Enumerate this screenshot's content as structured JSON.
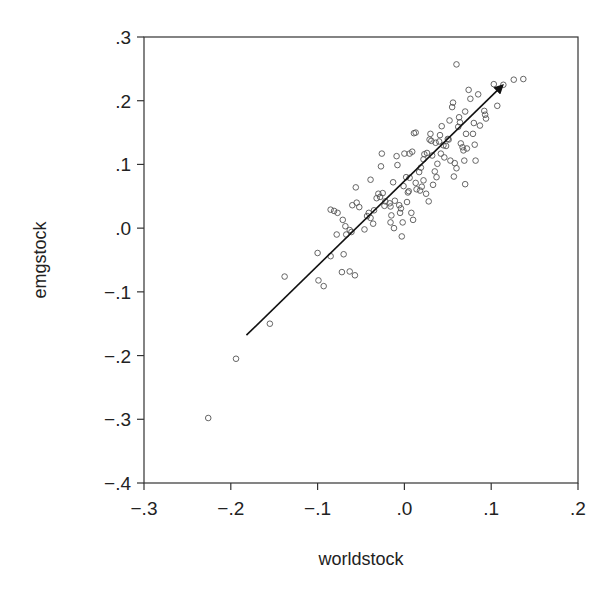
{
  "chart_data": {
    "type": "scatter",
    "title": "",
    "xlabel": "worldstock",
    "ylabel": "emgstock",
    "xlim": [
      -0.3,
      0.2
    ],
    "ylim": [
      -0.4,
      0.3
    ],
    "grid": false,
    "legend": null,
    "x_ticks": [
      -0.3,
      -0.2,
      -0.1,
      0.0,
      0.1,
      0.2
    ],
    "x_tick_labels": [
      "−.3",
      "−.2",
      "−.1",
      ".0",
      ".1",
      ".2"
    ],
    "y_ticks": [
      0.3,
      0.2,
      0.1,
      0.0,
      -0.1,
      -0.2,
      -0.3,
      -0.4
    ],
    "y_tick_labels": [
      ".3",
      ".2",
      ".1",
      ".0",
      "−.1",
      "−.2",
      "−.3",
      "−.4"
    ],
    "marker": "open-circle",
    "arrow": {
      "description": "Regression direction arrow",
      "start": [
        -0.182,
        -0.168
      ],
      "end": [
        0.113,
        0.224
      ],
      "color": "#111111"
    },
    "points": [
      [
        -0.226,
        -0.298
      ],
      [
        -0.194,
        -0.205
      ],
      [
        -0.155,
        -0.15
      ],
      [
        -0.138,
        -0.076
      ],
      [
        -0.1,
        -0.039
      ],
      [
        -0.099,
        -0.082
      ],
      [
        -0.093,
        -0.091
      ],
      [
        -0.085,
        -0.044
      ],
      [
        -0.07,
        -0.041
      ],
      [
        -0.072,
        -0.069
      ],
      [
        -0.063,
        -0.068
      ],
      [
        -0.057,
        -0.074
      ],
      [
        -0.078,
        -0.01
      ],
      [
        -0.081,
        0.027
      ],
      [
        -0.085,
        0.029
      ],
      [
        -0.077,
        0.024
      ],
      [
        -0.071,
        0.013
      ],
      [
        -0.068,
        0.003
      ],
      [
        -0.067,
        -0.01
      ],
      [
        -0.063,
        -0.003
      ],
      [
        -0.061,
        -0.006
      ],
      [
        -0.06,
        0.036
      ],
      [
        -0.056,
        0.064
      ],
      [
        -0.055,
        0.04
      ],
      [
        -0.052,
        0.033
      ],
      [
        -0.046,
        -0.002
      ],
      [
        -0.043,
        0.019
      ],
      [
        -0.041,
        0.024
      ],
      [
        -0.039,
        0.016
      ],
      [
        -0.036,
        0.007
      ],
      [
        -0.035,
        0.028
      ],
      [
        -0.039,
        0.076
      ],
      [
        -0.032,
        0.047
      ],
      [
        -0.03,
        0.054
      ],
      [
        -0.028,
        0.049
      ],
      [
        -0.027,
        0.097
      ],
      [
        -0.025,
        0.055
      ],
      [
        -0.023,
        0.035
      ],
      [
        -0.022,
        0.042
      ],
      [
        -0.017,
        0.039
      ],
      [
        -0.016,
        0.034
      ],
      [
        -0.015,
        0.02
      ],
      [
        -0.016,
        0.009
      ],
      [
        -0.026,
        0.117
      ],
      [
        -0.013,
        0.072
      ],
      [
        -0.012,
        0.0
      ],
      [
        -0.011,
        0.043
      ],
      [
        -0.009,
        0.113
      ],
      [
        -0.008,
        0.099
      ],
      [
        -0.006,
        0.036
      ],
      [
        -0.005,
        0.024
      ],
      [
        -0.004,
        0.031
      ],
      [
        -0.003,
        -0.013
      ],
      [
        -0.002,
        0.009
      ],
      [
        -0.001,
        0.066
      ],
      [
        0.0,
        0.117
      ],
      [
        0.002,
        0.08
      ],
      [
        0.003,
        0.041
      ],
      [
        0.005,
        0.058
      ],
      [
        0.006,
        0.117
      ],
      [
        0.009,
        0.12
      ],
      [
        0.011,
        0.149
      ],
      [
        0.013,
        0.15
      ],
      [
        0.006,
        0.079
      ],
      [
        0.004,
        0.056
      ],
      [
        0.008,
        0.024
      ],
      [
        0.01,
        0.013
      ],
      [
        0.013,
        0.071
      ],
      [
        0.014,
        0.061
      ],
      [
        0.017,
        0.088
      ],
      [
        0.018,
        0.059
      ],
      [
        0.02,
        0.065
      ],
      [
        0.019,
        0.095
      ],
      [
        0.022,
        0.075
      ],
      [
        0.022,
        0.108
      ],
      [
        0.023,
        0.116
      ],
      [
        0.025,
        0.054
      ],
      [
        0.026,
        0.118
      ],
      [
        0.028,
        0.042
      ],
      [
        0.029,
        0.139
      ],
      [
        0.03,
        0.148
      ],
      [
        0.031,
        0.137
      ],
      [
        0.032,
        0.114
      ],
      [
        0.033,
        0.068
      ],
      [
        0.035,
        0.089
      ],
      [
        0.036,
        0.134
      ],
      [
        0.037,
        0.08
      ],
      [
        0.038,
        0.101
      ],
      [
        0.04,
        0.136
      ],
      [
        0.041,
        0.146
      ],
      [
        0.042,
        0.117
      ],
      [
        0.043,
        0.16
      ],
      [
        0.045,
        0.13
      ],
      [
        0.046,
        0.111
      ],
      [
        0.048,
        0.129
      ],
      [
        0.05,
        0.14
      ],
      [
        0.051,
        0.139
      ],
      [
        0.052,
        0.169
      ],
      [
        0.053,
        0.106
      ],
      [
        0.055,
        0.19
      ],
      [
        0.056,
        0.197
      ],
      [
        0.057,
        0.081
      ],
      [
        0.058,
        0.102
      ],
      [
        0.06,
        0.094
      ],
      [
        0.062,
        0.159
      ],
      [
        0.063,
        0.174
      ],
      [
        0.064,
        0.166
      ],
      [
        0.065,
        0.133
      ],
      [
        0.067,
        0.127
      ],
      [
        0.068,
        0.122
      ],
      [
        0.069,
        0.106
      ],
      [
        0.07,
        0.183
      ],
      [
        0.071,
        0.148
      ],
      [
        0.072,
        0.125
      ],
      [
        0.07,
        0.069
      ],
      [
        0.074,
        0.217
      ],
      [
        0.076,
        0.203
      ],
      [
        0.079,
        0.148
      ],
      [
        0.08,
        0.165
      ],
      [
        0.081,
        0.131
      ],
      [
        0.082,
        0.106
      ],
      [
        0.085,
        0.21
      ],
      [
        0.087,
        0.161
      ],
      [
        0.092,
        0.184
      ],
      [
        0.093,
        0.178
      ],
      [
        0.094,
        0.172
      ],
      [
        0.103,
        0.226
      ],
      [
        0.107,
        0.192
      ],
      [
        0.114,
        0.225
      ],
      [
        0.126,
        0.233
      ],
      [
        0.137,
        0.234
      ],
      [
        0.06,
        0.257
      ]
    ]
  },
  "axes": {
    "x_title": "worldstock",
    "y_title": "emgstock"
  }
}
